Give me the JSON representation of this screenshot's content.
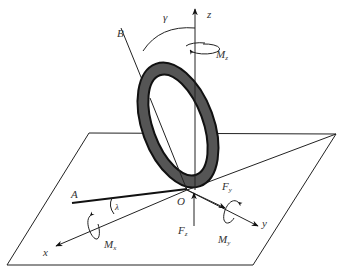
{
  "diagram": {
    "type": "tire-coordinate-system",
    "colors": {
      "line": "#222222",
      "tire_fill": "#555555",
      "tire_edge": "#111111",
      "label": "#333333",
      "background": "#ffffff"
    },
    "labels": {
      "z": "z",
      "x": "x",
      "y": "y",
      "B": "B",
      "A": "A",
      "O": "O",
      "gamma": "γ",
      "lambda": "λ",
      "Mz": {
        "main": "M",
        "sub": "z"
      },
      "Mx": {
        "main": "M",
        "sub": "x"
      },
      "My": {
        "main": "M",
        "sub": "y"
      },
      "Fy": {
        "main": "F",
        "sub": "y"
      },
      "Fz": {
        "main": "F",
        "sub": "z"
      }
    },
    "nodes": [
      {
        "id": "O",
        "desc": "origin / tire contact point"
      },
      {
        "id": "tire",
        "desc": "tilted tire ring"
      },
      {
        "id": "ground-plane",
        "desc": "road plane (parallelogram)"
      }
    ],
    "edges": [
      {
        "from": "O",
        "to": "z",
        "desc": "vertical z axis with moment Mz"
      },
      {
        "from": "O",
        "to": "x",
        "desc": "x axis with moment Mx"
      },
      {
        "from": "O",
        "to": "y",
        "desc": "y axis with moment My and force Fy"
      },
      {
        "from": "O",
        "to": "B",
        "desc": "wheel plane line, camber angle γ to z"
      },
      {
        "from": "O",
        "to": "A",
        "desc": "wheel heading line, slip angle λ to x"
      },
      {
        "from": "Fz",
        "to": "O",
        "desc": "vertical load Fz"
      }
    ]
  }
}
